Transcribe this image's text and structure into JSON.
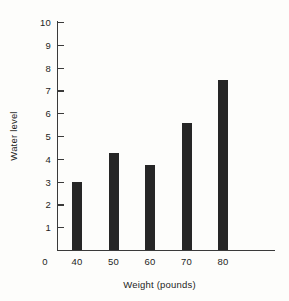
{
  "chart_data": {
    "type": "bar",
    "title": "",
    "xlabel": "Weight (pounds)",
    "ylabel": "Water level",
    "categories": [
      "40",
      "50",
      "60",
      "70",
      "80"
    ],
    "values": [
      3.0,
      4.25,
      3.75,
      5.55,
      7.45
    ],
    "xlim": [
      30,
      90
    ],
    "ylim": [
      0,
      10
    ],
    "y_ticks": [
      1,
      2,
      3,
      4,
      5,
      6,
      7,
      8,
      9,
      10
    ],
    "y_tick_labels": [
      "1",
      "2",
      "3",
      "4",
      "5",
      "6",
      "7",
      "8",
      "9",
      "10"
    ],
    "x_tick_labels": [
      "0",
      "40",
      "50",
      "60",
      "70",
      "80"
    ],
    "x_origin_label": "0",
    "grid": false,
    "legend": false,
    "bar_color": "#262626",
    "axis_color": "#3a3a3a",
    "background_color": "#fdfdfb"
  }
}
